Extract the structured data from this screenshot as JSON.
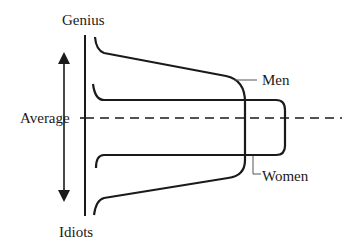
{
  "diagram": {
    "labels": {
      "top": "Genius",
      "bottom": "Idiots",
      "middle": "Average",
      "series_men": "Men",
      "series_women": "Women"
    },
    "colors": {
      "stroke": "#1a1a1a",
      "background": "#ffffff"
    }
  }
}
